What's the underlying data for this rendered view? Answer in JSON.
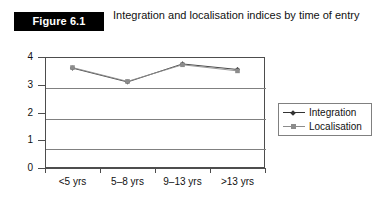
{
  "figure": {
    "label": "Figure 6.1",
    "title": "Integration and localisation indices by time of entry",
    "label_bg": "#000000",
    "label_fg": "#ffffff"
  },
  "chart_data": {
    "type": "line",
    "title": "Integration and localisation indices by time of entry",
    "xlabel": "",
    "ylabel": "",
    "categories": [
      "<5 yrs",
      "5–8 yrs",
      "9–13 yrs",
      ">13 yrs"
    ],
    "series": [
      {
        "name": "Integration",
        "color": "#333333",
        "marker": "diamond",
        "values": [
          3.6,
          3.1,
          3.75,
          3.55
        ]
      },
      {
        "name": "Localisation",
        "color": "#8c8c8c",
        "marker": "square",
        "values": [
          3.62,
          3.12,
          3.72,
          3.5
        ]
      }
    ],
    "ylim": [
      0,
      4
    ],
    "yticks": [
      0,
      1,
      2,
      3,
      4
    ],
    "ytick_labels": [
      "0",
      "1",
      "2",
      "3",
      "4"
    ],
    "grid": true,
    "grid_axis": "y",
    "legend_position": "right"
  }
}
